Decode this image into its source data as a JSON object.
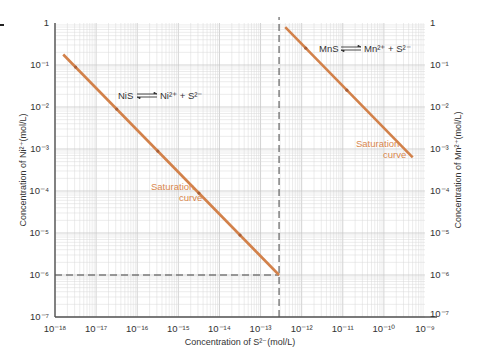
{
  "chart_data": {
    "type": "line",
    "title": "",
    "xlabel": "Concentration of S²⁻(mol/L)",
    "ylabel_left": "Concentration of Ni²⁺(mol/L)",
    "ylabel_right": "Concentration of Mn²⁺(mol/L)",
    "x_scale": "log",
    "y_scale": "log",
    "xlim_exp": [
      -18,
      -9
    ],
    "ylim_exp": [
      -7,
      0
    ],
    "x_ticks": [
      "10⁻¹⁸",
      "10⁻¹⁷",
      "10⁻¹⁶",
      "10⁻¹⁵",
      "10⁻¹⁴",
      "10⁻¹³",
      "10⁻¹²",
      "10⁻¹¹",
      "10⁻¹⁰",
      "10⁻⁹"
    ],
    "y_ticks_left": [
      "1",
      "10⁻¹",
      "10⁻²",
      "10⁻³",
      "10⁻⁴",
      "10⁻⁵",
      "10⁻⁶",
      "10⁻⁷"
    ],
    "y_ticks_right": [
      "1",
      "10⁻¹",
      "10⁻²",
      "10⁻³",
      "10⁻⁴",
      "10⁻⁵",
      "10⁻⁶",
      "10⁻⁷"
    ],
    "grid": true,
    "series": [
      {
        "name": "NiS saturation curve",
        "equation": "NiS ⇌ Ni²⁺ + S²⁻",
        "color": "#d2814a",
        "x_exp": [
          -17.8,
          -12.55
        ],
        "y_exp": [
          -0.75,
          -6.0
        ],
        "markers_x_exp": [
          -17.5,
          -16.5,
          -15.5,
          -14.5,
          -13.5
        ],
        "label": [
          "Saturation",
          "curve"
        ]
      },
      {
        "name": "MnS saturation curve",
        "equation": "MnS ⇌ Mn²⁺ + S²⁻",
        "color": "#d2814a",
        "x_exp": [
          -12.4,
          -9.3
        ],
        "y_exp": [
          -0.1,
          -3.2
        ],
        "markers_x_exp": [
          -11.9,
          -10.9
        ],
        "label": [
          "Saturation",
          "curve"
        ]
      }
    ],
    "reference_lines": [
      {
        "type": "horizontal",
        "y_exp": -6,
        "x_from_exp": -18,
        "x_to_exp": -12.55,
        "style": "dashed"
      },
      {
        "type": "vertical",
        "x_exp": -12.55,
        "y_from_exp": -7,
        "y_to_exp": 0,
        "style": "dashed"
      }
    ]
  },
  "annotations": {
    "nis_equation": {
      "left": "NiS",
      "right": "Ni²⁺ + S²⁻"
    },
    "mns_equation": {
      "left": "MnS",
      "right": "Mn²⁺ + S²⁻"
    },
    "nis_saturation_label": [
      "Saturation",
      "curve"
    ],
    "mns_saturation_label": [
      "Saturation",
      "curve"
    ]
  },
  "colors": {
    "curve": "#d2814a",
    "curve_label": "#d9874e",
    "grid": "#d9d9d9",
    "axis": "#555555",
    "dash": "#444444"
  }
}
